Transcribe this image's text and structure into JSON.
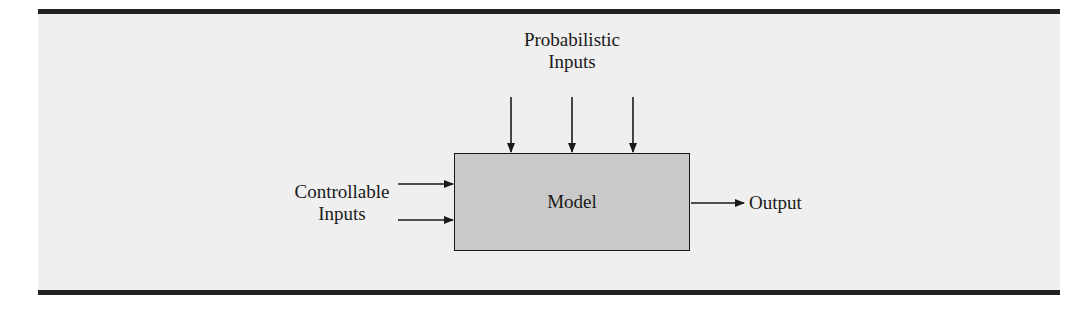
{
  "diagram": {
    "type": "block-diagram",
    "central_block": {
      "label": "Model"
    },
    "inputs": {
      "probabilistic": {
        "label_line1": "Probabilistic",
        "label_line2": "Inputs",
        "arrow_count": 3,
        "direction": "top-down"
      },
      "controllable": {
        "label_line1": "Controllable",
        "label_line2": "Inputs",
        "arrow_count": 2,
        "direction": "left-to-right"
      }
    },
    "output": {
      "label": "Output",
      "arrow_count": 1,
      "direction": "left-to-right"
    }
  },
  "colors": {
    "panel_background": "#efefef",
    "rule": "#222222",
    "model_fill": "#c9c9c9",
    "stroke": "#1a1a1a"
  }
}
